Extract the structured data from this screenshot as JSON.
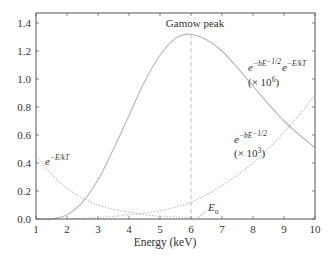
{
  "chart_data": {
    "type": "line",
    "title": "",
    "xlabel": "Energy (keV)",
    "ylabel": "",
    "xlim": [
      1,
      10
    ],
    "ylim": [
      0,
      1.4
    ],
    "grid": false,
    "x_ticks": [
      "1",
      "2",
      "3",
      "4",
      "5",
      "6",
      "7",
      "8",
      "9",
      "10"
    ],
    "y_ticks": [
      "0.0",
      "0.2",
      "0.4",
      "0.6",
      "0.8",
      "1.0",
      "1.2",
      "1.4"
    ],
    "series": [
      {
        "name": "e^{-E/kT}",
        "style": "dotted",
        "x": [
          1,
          1.5,
          2,
          2.5,
          3,
          3.5,
          4,
          4.5,
          5,
          5.5,
          6
        ],
        "values": [
          0.45,
          0.32,
          0.22,
          0.15,
          0.1,
          0.07,
          0.05,
          0.03,
          0.02,
          0.015,
          0.01
        ]
      },
      {
        "name": "e^{-bE^{-1/2}} (x 10^3)",
        "style": "dotted",
        "x": [
          2,
          3,
          4,
          5,
          6,
          7,
          8,
          9,
          10
        ],
        "values": [
          0.0,
          0.01,
          0.03,
          0.06,
          0.12,
          0.24,
          0.4,
          0.62,
          0.88
        ]
      },
      {
        "name": "e^{-bE^{-1/2}} e^{-E/kT} (x 10^6)",
        "style": "solid",
        "x": [
          1,
          1.5,
          2,
          2.5,
          3,
          3.5,
          4,
          4.5,
          5,
          5.5,
          6,
          6.5,
          7,
          7.5,
          8,
          8.5,
          9,
          9.5,
          10
        ],
        "values": [
          0.0,
          0.0,
          0.03,
          0.12,
          0.28,
          0.5,
          0.74,
          0.98,
          1.17,
          1.29,
          1.32,
          1.28,
          1.2,
          1.08,
          0.95,
          0.82,
          0.7,
          0.6,
          0.51
        ]
      }
    ],
    "annotations": [
      {
        "text": "Gamow peak",
        "x": 6,
        "y": 1.38
      },
      {
        "text": "E_o",
        "x": 6.5,
        "y": 0.06
      },
      {
        "text": "e^{-E/kT}",
        "x": 1.2,
        "y": 0.38
      },
      {
        "text": "e^{-bE^{-1/2}} (x 10^3)",
        "x": 7.7,
        "y": 0.3
      },
      {
        "text": "e^{-bE^{-1/2}} e^{-E/kT} (x 10^6)",
        "x": 7.9,
        "y": 1.1
      }
    ],
    "vline": {
      "x": 6,
      "style": "dashed"
    }
  },
  "labels": {
    "gamow_peak": "Gamow peak",
    "e0_main": "E",
    "e0_sub": "o",
    "ekt_base": "e",
    "ekt_sup": "−E/kT",
    "b_base": "e",
    "b_sup": "−bE",
    "b_sup2": "−1/2",
    "b_scale": "(× 10",
    "b_scale_exp": "3",
    "b_scale_close": ")",
    "g_base1": "e",
    "g_sup1": "−bE",
    "g_sup1b": "−1/2",
    "g_base2": "e",
    "g_sup2": "−E/kT",
    "g_scale": "(× 10",
    "g_scale_exp": "6",
    "g_scale_close": ")",
    "xlabel": "Energy (keV)"
  }
}
